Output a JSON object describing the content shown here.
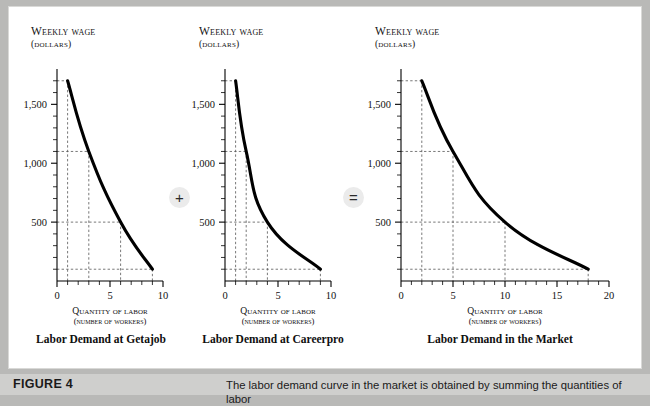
{
  "figure": {
    "label": "FIGURE 4",
    "caption": "The labor demand curve in the market is obtained by summing the quantities of labor"
  },
  "operators": {
    "plus": "+",
    "equals": "="
  },
  "axis_titles": {
    "y_line1": "Weekly wage",
    "y_line2": "(dollars)",
    "x_line1": "Quantity of labor",
    "x_line2": "(number of workers)"
  },
  "chart_data": [
    {
      "type": "line",
      "title": "Labor Demand at Getajob",
      "xlabel": "Quantity of labor (number of workers)",
      "ylabel": "Weekly wage (dollars)",
      "x": [
        1,
        3,
        6,
        9
      ],
      "values": [
        1700,
        1100,
        500,
        100
      ],
      "xlim": [
        0,
        10
      ],
      "ylim": [
        0,
        1800
      ],
      "xticks": [
        0,
        5,
        10
      ],
      "xtick_labels": [
        "0",
        "5",
        "10"
      ],
      "x_minor_step": 1,
      "yticks": [
        500,
        1000,
        1500
      ],
      "ytick_labels": [
        "500",
        "1,000",
        "1,500"
      ],
      "y_minor_step": 100,
      "guides": [
        {
          "x": 1,
          "y": 1700
        },
        {
          "x": 3,
          "y": 1100
        },
        {
          "x": 6,
          "y": 500
        },
        {
          "x": 9,
          "y": 100
        }
      ],
      "grid": false,
      "legend": "none"
    },
    {
      "type": "line",
      "title": "Labor Demand at Careerpro",
      "xlabel": "Quantity of labor (number of workers)",
      "ylabel": "Weekly wage (dollars)",
      "x": [
        1,
        2,
        4,
        9
      ],
      "values": [
        1700,
        1100,
        500,
        100
      ],
      "xlim": [
        0,
        10
      ],
      "ylim": [
        0,
        1800
      ],
      "xticks": [
        0,
        5,
        10
      ],
      "xtick_labels": [
        "0",
        "5",
        "10"
      ],
      "x_minor_step": 1,
      "yticks": [
        500,
        1000,
        1500
      ],
      "ytick_labels": [
        "500",
        "1,000",
        "1,500"
      ],
      "y_minor_step": 100,
      "guides": [
        {
          "x": 1,
          "y": 1700
        },
        {
          "x": 2,
          "y": 1100
        },
        {
          "x": 4,
          "y": 500
        },
        {
          "x": 9,
          "y": 100
        }
      ],
      "grid": false,
      "legend": "none"
    },
    {
      "type": "line",
      "title": "Labor Demand in the Market",
      "xlabel": "Quantity of labor (number of workers)",
      "ylabel": "Weekly wage (dollars)",
      "x": [
        2,
        5,
        10,
        18
      ],
      "values": [
        1700,
        1100,
        500,
        100
      ],
      "xlim": [
        0,
        20
      ],
      "ylim": [
        0,
        1800
      ],
      "xticks": [
        0,
        5,
        10,
        15,
        20
      ],
      "xtick_labels": [
        "0",
        "5",
        "10",
        "15",
        "20"
      ],
      "x_minor_step": 1,
      "yticks": [
        500,
        1000,
        1500
      ],
      "ytick_labels": [
        "500",
        "1,000",
        "1,500"
      ],
      "y_minor_step": 100,
      "guides": [
        {
          "x": 2,
          "y": 1700
        },
        {
          "x": 5,
          "y": 1100
        },
        {
          "x": 10,
          "y": 500
        },
        {
          "x": 18,
          "y": 100
        }
      ],
      "grid": false,
      "legend": "none"
    }
  ],
  "colors": {
    "page_background": "#b9b9b7",
    "panel_background": "#ffffff",
    "curve": "#000000",
    "guide_line": "#555555",
    "axis": "#000000",
    "caption_bar": "#cfcfcd",
    "operator_badge": "#ebebeb"
  }
}
